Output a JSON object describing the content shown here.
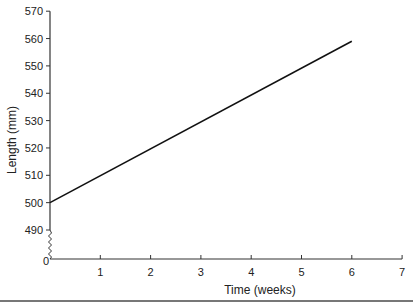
{
  "chart_data": {
    "type": "line",
    "title": "",
    "xlabel": "Time (weeks)",
    "ylabel": "Length (mm)",
    "x_ticks": [
      "0",
      "1",
      "2",
      "3",
      "4",
      "5",
      "6",
      "7"
    ],
    "y_ticks": [
      "0",
      "490",
      "500",
      "510",
      "520",
      "530",
      "540",
      "550",
      "560",
      "570"
    ],
    "xlim": [
      0,
      7
    ],
    "ylim": [
      490,
      570
    ],
    "axis_break": "y-axis broken between 0 and 490",
    "grid": false,
    "legend": null,
    "series": [
      {
        "name": "Length",
        "x": [
          0,
          6
        ],
        "y": [
          500,
          559
        ]
      }
    ]
  }
}
